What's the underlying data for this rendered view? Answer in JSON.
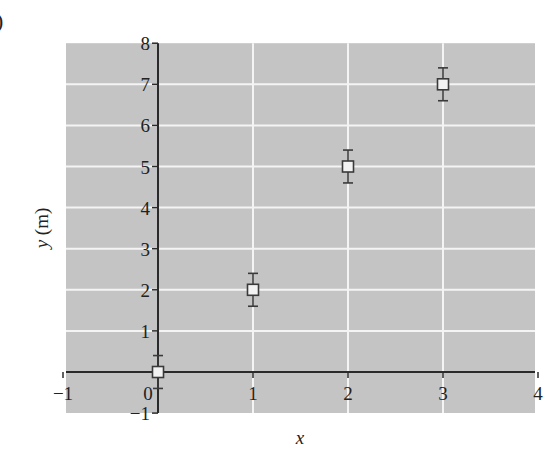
{
  "chart_data": {
    "type": "scatter",
    "title": "",
    "panel_label_fragment": ")",
    "xlabel": "x",
    "ylabel": "y (m)",
    "xlim": [
      -1,
      4
    ],
    "ylim": [
      -1,
      8
    ],
    "x_ticks": [
      -1,
      0,
      1,
      2,
      3,
      4
    ],
    "y_ticks": [
      -1,
      0,
      1,
      2,
      3,
      4,
      5,
      6,
      7,
      8
    ],
    "grid": true,
    "legend": null,
    "series": [
      {
        "name": "data",
        "marker": "open-square",
        "points": [
          {
            "x": 0,
            "y": 0,
            "yerr": 0.4
          },
          {
            "x": 1,
            "y": 2,
            "yerr": 0.4
          },
          {
            "x": 2,
            "y": 5,
            "yerr": 0.4
          },
          {
            "x": 3,
            "y": 7,
            "yerr": 0.4
          }
        ]
      }
    ]
  },
  "colors": {
    "plot_background": "#c4c4c4",
    "gridline": "#f4f4f4",
    "axis": "#2a2a2a",
    "marker_fill": "#f2f2f2",
    "marker_edge": "#3a3a3a"
  }
}
